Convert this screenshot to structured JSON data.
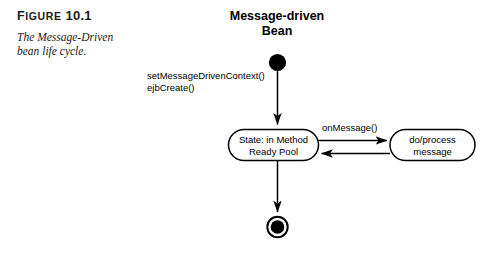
{
  "figure": {
    "label_word": "Figure",
    "label_number": "10.1",
    "caption_line1": "The Message-Driven",
    "caption_line2": "bean life cycle."
  },
  "diagram": {
    "title_line1": "Message-driven",
    "title_line2": "Bean",
    "type": "uml-state-diagram",
    "stroke_color": "#000000",
    "background_color": "#ffffff",
    "nodes": {
      "initial_state": {
        "name": "initial-state",
        "shape": "filled-circle"
      },
      "ready_pool": {
        "name": "state-method-ready-pool",
        "shape": "rounded-rect",
        "line1": "State: in Method",
        "line2": "Ready Pool"
      },
      "process_message": {
        "name": "state-process-message",
        "shape": "rounded-rect",
        "line1": "do/process",
        "line2": "message"
      },
      "final_state": {
        "name": "final-state",
        "shape": "bullseye"
      }
    },
    "transitions": [
      {
        "name": "transition-create",
        "from": "initial_state",
        "to": "ready_pool",
        "label_line1": "setMessageDrivenContext()",
        "label_line2": "ejbCreate()"
      },
      {
        "name": "transition-on-message",
        "from": "ready_pool",
        "to": "process_message",
        "label_line1": "onMessage()",
        "label_line2": ""
      },
      {
        "name": "transition-return",
        "from": "process_message",
        "to": "ready_pool",
        "label_line1": "",
        "label_line2": ""
      },
      {
        "name": "transition-remove",
        "from": "ready_pool",
        "to": "final_state",
        "label_line1": "",
        "label_line2": ""
      }
    ]
  }
}
